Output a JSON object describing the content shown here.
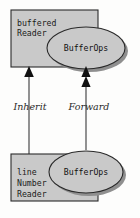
{
  "diagram": {
    "type": "uml-class-delegation",
    "background_color": "#fdfdfc",
    "shape_fill": "#c9c9c9",
    "shape_stroke": "#2a2a2a",
    "shadow_color": "#8f8f8f",
    "nodes": {
      "super_class": {
        "kind": "class-box",
        "label_lines": [
          "buffered",
          "Reader"
        ],
        "line1": "buffered",
        "line2": "Reader"
      },
      "super_interface": {
        "kind": "ellipse",
        "label": "BufferOps"
      },
      "sub_class": {
        "kind": "class-box",
        "label_lines": [
          "line",
          "Number",
          "Reader"
        ],
        "line1": "line",
        "line2": "Number",
        "line3": "Reader"
      },
      "sub_interface": {
        "kind": "ellipse",
        "label": "BufferOps"
      }
    },
    "edges": {
      "inherit": {
        "label": "Inherit",
        "arrow": "single-solid-triangle",
        "direction": "up",
        "from": "line Number Reader",
        "to": "buffered Reader"
      },
      "forward": {
        "label": "Forward",
        "arrow": "double-solid-triangle",
        "direction": "up",
        "from": "BufferOps (sub)",
        "to": "BufferOps (super)"
      }
    }
  }
}
